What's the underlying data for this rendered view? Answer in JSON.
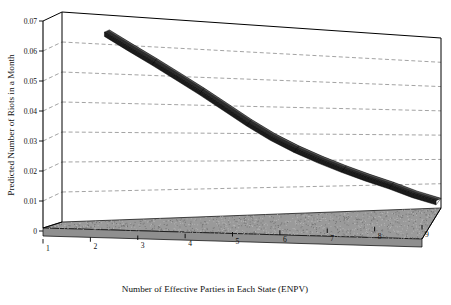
{
  "chart_data": {
    "type": "line",
    "title": "",
    "xlabel": "Number of Effective Parties in Each State (ENPV)",
    "ylabel": "Predicted Number of Riots in a Month",
    "xlim": [
      1,
      9
    ],
    "ylim": [
      0,
      0.07
    ],
    "grid": true,
    "legend": "none",
    "projection": "3d",
    "x_ticks": [
      "1",
      "2",
      "3",
      "4",
      "5",
      "6",
      "7",
      "8",
      "9"
    ],
    "y_ticks": [
      "0",
      "0.01",
      "0.02",
      "0.03",
      "0.04",
      "0.05",
      "0.06",
      "0.07"
    ],
    "x": [
      2,
      2.5,
      3,
      3.5,
      4,
      4.5,
      5,
      5.5,
      6,
      6.5,
      7,
      7.5,
      8,
      8.5,
      9
    ],
    "series": [
      {
        "name": "Predicted riots",
        "color": "#2b2b2b",
        "values": [
          0.065,
          0.0605,
          0.056,
          0.0512,
          0.0462,
          0.0408,
          0.0352,
          0.03,
          0.0255,
          0.0215,
          0.0178,
          0.0143,
          0.011,
          0.0072,
          0.004
        ]
      }
    ]
  },
  "axes": {
    "y_title": "Predicted Number of Riots in a Month",
    "x_title": "Number of Effective Parties in Each State (ENPV)",
    "y_tick_labels": [
      "0.07",
      "0.06",
      "0.05",
      "0.04",
      "0.03",
      "0.02",
      "0.01",
      "0"
    ],
    "x_tick_labels": [
      "1",
      "2",
      "3",
      "4",
      "5",
      "6",
      "7",
      "8",
      "9"
    ]
  },
  "style": {
    "floor_color": "#9a9a9a",
    "line_color": "#2b2b2b",
    "grid_color": "#8c8c8c",
    "axis_color": "#000000",
    "background": "#ffffff"
  }
}
